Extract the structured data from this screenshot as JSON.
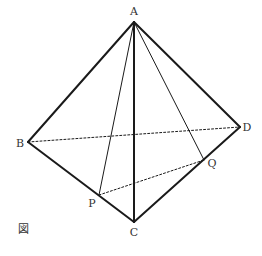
{
  "diagram": {
    "type": "tetrahedron",
    "caption_mark": "図",
    "vertices": [
      {
        "id": "A",
        "label": "A",
        "x": 134,
        "y": 22,
        "lx": 134,
        "ly": 15
      },
      {
        "id": "B",
        "label": "B",
        "x": 28,
        "y": 142,
        "lx": 20,
        "ly": 147
      },
      {
        "id": "C",
        "label": "C",
        "x": 134,
        "y": 222,
        "lx": 134,
        "ly": 236
      },
      {
        "id": "D",
        "label": "D",
        "x": 240,
        "y": 127,
        "lx": 247,
        "ly": 131
      },
      {
        "id": "P",
        "label": "P",
        "x": 99,
        "y": 195,
        "lx": 92,
        "ly": 207
      },
      {
        "id": "Q",
        "label": "Q",
        "x": 204,
        "y": 160,
        "lx": 212,
        "ly": 167
      }
    ],
    "edges": [
      {
        "from": "A",
        "to": "B",
        "style": "solid",
        "weight": "thick"
      },
      {
        "from": "A",
        "to": "C",
        "style": "solid",
        "weight": "thick"
      },
      {
        "from": "A",
        "to": "D",
        "style": "solid",
        "weight": "thick"
      },
      {
        "from": "B",
        "to": "C",
        "style": "solid",
        "weight": "thick"
      },
      {
        "from": "C",
        "to": "D",
        "style": "solid",
        "weight": "thick"
      },
      {
        "from": "A",
        "to": "P",
        "style": "solid",
        "weight": "thin"
      },
      {
        "from": "A",
        "to": "Q",
        "style": "solid",
        "weight": "thin"
      },
      {
        "from": "B",
        "to": "D",
        "style": "dashed",
        "weight": "thin"
      },
      {
        "from": "P",
        "to": "Q",
        "style": "dashed",
        "weight": "thin"
      }
    ],
    "colors": {
      "stroke": "#1a1a1a",
      "label": "#333333",
      "background": "#ffffff"
    }
  }
}
